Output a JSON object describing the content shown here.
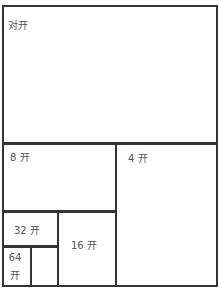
{
  "diagram": {
    "regions": [
      {
        "id": "duikai",
        "label": "对开"
      },
      {
        "id": "4kai",
        "label": "4 开"
      },
      {
        "id": "8kai",
        "label": "8 开"
      },
      {
        "id": "16kai",
        "label": "16 开"
      },
      {
        "id": "32kai",
        "label": "32 开"
      },
      {
        "id": "64kai",
        "label_line1": "64",
        "label_line2": "开"
      }
    ]
  }
}
